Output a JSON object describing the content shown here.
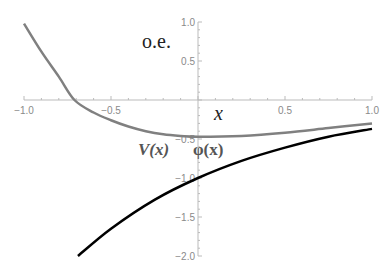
{
  "chart_data": {
    "type": "line",
    "title": "",
    "xlabel": "x",
    "ylabel": "",
    "xlim": [
      -1.0,
      1.0
    ],
    "ylim": [
      -2.0,
      1.0
    ],
    "grid": false,
    "x_ticks": [
      "-1.0",
      "-0.5",
      "0.5",
      "1.0"
    ],
    "y_ticks": [
      "1.0",
      "0.5",
      "-0.5",
      "-1.0",
      "-1.5",
      "-2.0"
    ],
    "annotations": [
      "o.e.",
      "V(x)",
      "φ(x)"
    ],
    "series": [
      {
        "name": "V(x)",
        "color": "#808080",
        "x": [
          -1.0,
          -0.9,
          -0.8,
          -0.71,
          -0.6,
          -0.5,
          -0.4,
          -0.3,
          -0.2,
          -0.1,
          0.0,
          0.25,
          0.5,
          0.75,
          1.0
        ],
        "y": [
          0.98,
          0.62,
          0.3,
          0.0,
          -0.16,
          -0.26,
          -0.34,
          -0.4,
          -0.44,
          -0.46,
          -0.47,
          -0.46,
          -0.42,
          -0.36,
          -0.3
        ]
      },
      {
        "name": "φ(x)",
        "color": "#000000",
        "x": [
          -0.69,
          -0.5,
          -0.25,
          0.0,
          0.25,
          0.5,
          0.75,
          1.0
        ],
        "y": [
          -2.0,
          -1.65,
          -1.28,
          -1.0,
          -0.78,
          -0.61,
          -0.47,
          -0.37
        ]
      }
    ]
  },
  "labels": {
    "oe": "o.e.",
    "x": "x",
    "V": "V(x)",
    "phi": "φ(x)"
  }
}
